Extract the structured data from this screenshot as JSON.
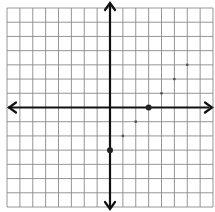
{
  "graph": {
    "type": "coordinate-plane",
    "x_range": [
      -8,
      8
    ],
    "y_range": [
      -7,
      7
    ],
    "grid_columns": 16,
    "grid_rows": 14,
    "colors": {
      "background": "#ffffff",
      "grid": "#8a8a8a",
      "axis": "#111111",
      "point": "#222222"
    },
    "plotted_line": "y = x - 3",
    "key_points": [
      {
        "x": 0,
        "y": -3,
        "style": "large",
        "label": "y-intercept"
      },
      {
        "x": 3,
        "y": 0,
        "style": "large",
        "label": "x-intercept"
      }
    ],
    "small_points": [
      {
        "x": 1,
        "y": -2
      },
      {
        "x": 2,
        "y": -1
      },
      {
        "x": 4,
        "y": 1
      },
      {
        "x": 5,
        "y": 2
      },
      {
        "x": 6,
        "y": 3
      }
    ]
  },
  "chart_data": {
    "type": "scatter",
    "title": "",
    "xlabel": "",
    "ylabel": "",
    "xlim": [
      -8,
      8
    ],
    "ylim": [
      -7,
      7
    ],
    "grid": true,
    "series": [
      {
        "name": "plotted points",
        "x": [
          0,
          1,
          2,
          3,
          4,
          5,
          6
        ],
        "y": [
          -3,
          -2,
          -1,
          0,
          1,
          2,
          3
        ]
      }
    ]
  }
}
